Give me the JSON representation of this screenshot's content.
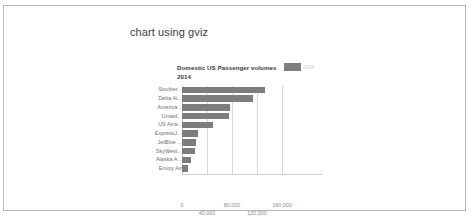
{
  "page": {
    "heading": "chart using gviz",
    "frame_border_color": "#b8b8b8",
    "background": "#ffffff"
  },
  "legend": {
    "label": "2014",
    "swatch_color": "#7d7d7d"
  },
  "chart_data": {
    "type": "bar",
    "orientation": "horizontal",
    "title": "Domestic US Passenger volumes 2014",
    "title_line_1": "Domestic US Passenger volumes",
    "title_line_2": "2014",
    "xlabel": "",
    "ylabel": "",
    "xlim": [
      0,
      180000
    ],
    "grid": true,
    "legend_position": "top-right",
    "bar_color": "#7d7d7d",
    "gridline_color": "#d6d6d6",
    "tick_labels": [
      "0",
      "40,000",
      "80,000",
      "120,000",
      "160,000"
    ],
    "tick_values": [
      0,
      40000,
      80000,
      120000,
      160000
    ],
    "categories": [
      "Souther...",
      "Delta Ai...",
      "America...",
      "United...",
      "US Airw...",
      "ExpressJ...",
      "JetBlue ...",
      "SkyWest...",
      "Alaska A...",
      "Envoy Air"
    ],
    "series": [
      {
        "name": "2014",
        "values": [
          133000,
          114000,
          77000,
          75000,
          49000,
          26000,
          22000,
          21000,
          14000,
          10000
        ]
      }
    ]
  }
}
